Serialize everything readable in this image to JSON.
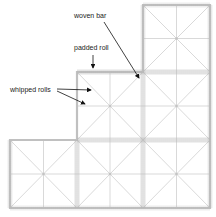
{
  "diagram": {
    "title": "",
    "labels": {
      "woven_bar": "woven bar",
      "padded_roll": "padded roll",
      "whipped_rolls": "whipped rolls"
    },
    "grid": {
      "columns": 3,
      "rows": 3,
      "filled_cells": [
        {
          "row": 0,
          "col": 2
        },
        {
          "row": 1,
          "col": 1
        },
        {
          "row": 1,
          "col": 2
        },
        {
          "row": 2,
          "col": 0
        },
        {
          "row": 2,
          "col": 1
        },
        {
          "row": 2,
          "col": 2
        }
      ],
      "cell_pattern": "square divided by vertical, horizontal and two diagonal lines",
      "line_color": "#c8c8c8",
      "border_color": "#bdbdbd",
      "arrow_color": "#111111"
    }
  }
}
